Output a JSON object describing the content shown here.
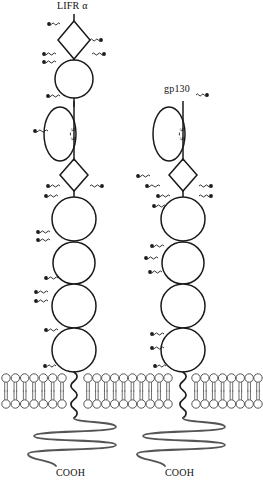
{
  "figure": {
    "type": "protein-receptor-schematic",
    "background": "#ffffff",
    "line_color": "#1a1a1a",
    "membrane_color": "#555555",
    "width": 263,
    "height": 491
  },
  "labels": {
    "receptor_1": "LIFR α",
    "receptor_2": "gp130",
    "c_terminus_1": "COOH",
    "c_terminus_2": "COOH",
    "disulfide": "S–S"
  },
  "receptors": [
    {
      "name": "LIFR α",
      "center_x": 74,
      "domains": [
        {
          "kind": "stalk",
          "y": 14,
          "height": 14
        },
        {
          "kind": "diamond",
          "cy": 40,
          "rx": 16,
          "ry": 19
        },
        {
          "kind": "circle",
          "cy": 79,
          "r": 19
        },
        {
          "kind": "ellipse",
          "cy": 134,
          "rx": 16,
          "ry": 27,
          "disulfide": true
        },
        {
          "kind": "diamond",
          "cy": 175,
          "rx": 14,
          "ry": 16
        },
        {
          "kind": "circle",
          "cy": 219,
          "r": 22
        },
        {
          "kind": "circle",
          "cy": 263,
          "r": 21
        },
        {
          "kind": "circle",
          "cy": 306,
          "r": 22
        },
        {
          "kind": "circle",
          "cy": 350,
          "r": 22
        },
        {
          "kind": "transmembrane-helix",
          "y_top": 372,
          "y_bottom": 418
        },
        {
          "kind": "intracellular-tail",
          "y_top": 418,
          "y_bottom": 466
        }
      ],
      "glycosylation_sites": 13
    },
    {
      "name": "gp130",
      "center_x": 183,
      "domains": [
        {
          "kind": "ellipse",
          "cy": 134,
          "rx": 16,
          "ry": 27,
          "disulfide": true
        },
        {
          "kind": "diamond",
          "cy": 175,
          "rx": 14,
          "ry": 16
        },
        {
          "kind": "circle",
          "cy": 219,
          "r": 22
        },
        {
          "kind": "circle",
          "cy": 263,
          "r": 21
        },
        {
          "kind": "circle",
          "cy": 306,
          "r": 22
        },
        {
          "kind": "circle",
          "cy": 350,
          "r": 22
        },
        {
          "kind": "transmembrane-helix",
          "y_top": 372,
          "y_bottom": 418
        },
        {
          "kind": "intracellular-tail",
          "y_top": 418,
          "y_bottom": 466
        }
      ],
      "glycosylation_sites": 10
    }
  ],
  "membrane": {
    "y_top": 378,
    "y_bottom": 404,
    "head_radius": 4.2,
    "segments": [
      {
        "x_start": 6,
        "x_end": 62,
        "lipids": 7
      },
      {
        "x_start": 88,
        "x_end": 168,
        "lipids": 10
      },
      {
        "x_start": 196,
        "x_end": 258,
        "lipids": 8
      }
    ]
  }
}
